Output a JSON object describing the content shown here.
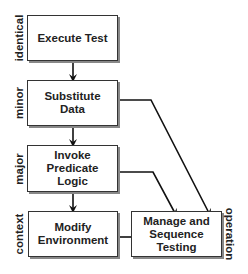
{
  "diagram": {
    "nodes": [
      {
        "id": "execute",
        "label": "Execute Test"
      },
      {
        "id": "substitute",
        "label": "Substitute\nData"
      },
      {
        "id": "predicate",
        "label": "Invoke\nPredicate\nLogic"
      },
      {
        "id": "modify",
        "label": "Modify\nEnvironment"
      },
      {
        "id": "manage",
        "label": "Manage and\nSequence\nTesting"
      }
    ],
    "side_labels": {
      "identical": "identical",
      "minor": "minor",
      "major": "major",
      "context": "context",
      "operation": "operation"
    },
    "edges": [
      {
        "from": "execute",
        "to": "substitute"
      },
      {
        "from": "substitute",
        "to": "predicate"
      },
      {
        "from": "predicate",
        "to": "modify"
      },
      {
        "from": "modify",
        "to": "manage"
      },
      {
        "from": "substitute",
        "to": "manage"
      },
      {
        "from": "predicate",
        "to": "manage"
      }
    ]
  }
}
